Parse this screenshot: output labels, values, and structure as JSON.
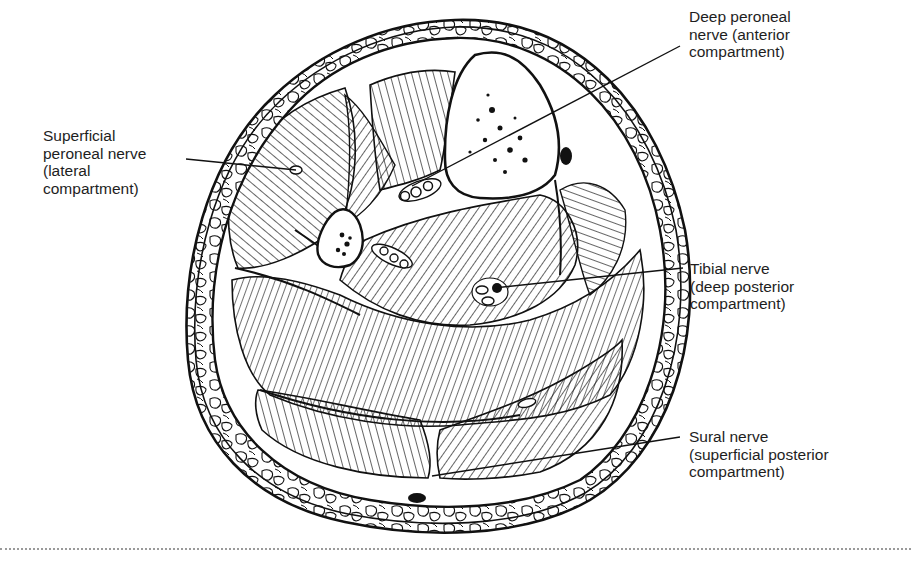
{
  "figure": {
    "colors": {
      "ink": "#111111",
      "background": "#ffffff",
      "divider": "#9a9a9a"
    }
  },
  "labels": {
    "deep_peroneal": {
      "lines": [
        "Deep peroneal",
        "nerve (anterior",
        "compartment)"
      ]
    },
    "superficial_peroneal": {
      "lines": [
        "Superficial",
        "peroneal nerve",
        "(lateral",
        "compartment)"
      ]
    },
    "tibial": {
      "lines": [
        "Tibial nerve",
        "(deep posterior",
        "compartment)"
      ]
    },
    "sural": {
      "lines": [
        "Sural nerve",
        "(superficial posterior",
        "compartment)"
      ]
    }
  }
}
